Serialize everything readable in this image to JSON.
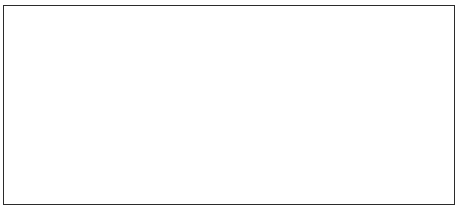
{
  "chart_data": {
    "type": "line",
    "title": "",
    "xlabel": "",
    "ylabel": "",
    "ylim": [
      0,
      1800
    ],
    "ytick_step": 200,
    "grid": true,
    "legend_position": "right",
    "x": [
      1976,
      1977,
      1978,
      1979,
      1980,
      1981,
      1982,
      1983,
      1984,
      1985,
      1986,
      1987,
      1988,
      1989,
      1990,
      1991,
      1992,
      1993,
      1994,
      1995,
      1996,
      1997,
      1998,
      1999,
      2000,
      2001,
      2002,
      2003
    ],
    "xtick_labels": [
      "1976",
      "",
      "1978",
      "",
      "1980",
      "",
      "1982",
      "",
      "1984",
      "",
      "1986",
      "",
      "1988",
      "",
      "1990",
      "",
      "1992",
      "",
      "1994",
      "",
      "1996",
      "",
      "1998",
      "",
      "2000",
      "",
      "2002",
      ""
    ],
    "xtick_labels_shown": [
      "1976",
      "1978",
      "1980",
      "1982",
      "1984",
      "1986",
      "1988",
      "1990",
      "1992",
      "1994",
      "1996",
      "1998",
      "2000",
      "2002"
    ],
    "yticks": [
      0,
      200,
      400,
      600,
      800,
      1000,
      1200,
      1400,
      1600,
      1800
    ],
    "ytick_labels": [
      "0",
      "200",
      "400",
      "600",
      "800",
      "1,000",
      "1,200",
      "1,400",
      "1,600",
      "1,800"
    ],
    "series": [
      {
        "name": "Male",
        "marker": "diamond",
        "color": "#000000",
        "values": [
          1380,
          1310,
          1190,
          1240,
          1250,
          1160,
          1100,
          1070,
          1030,
          1000,
          1000,
          1010,
          970,
          900,
          880,
          880,
          830,
          800,
          700,
          680,
          680,
          690,
          560,
          530,
          500,
          470,
          440,
          390
        ]
      },
      {
        "name": "Female",
        "marker": "square",
        "color": "#000000",
        "values": [
          1600,
          1450,
          1470,
          1500,
          1520,
          1550,
          1540,
          1480,
          1440,
          1520,
          1560,
          1550,
          1420,
          1450,
          1560,
          1400,
          1400,
          1550,
          1500,
          1340,
          1280,
          1300,
          1240,
          1300,
          1250,
          1250,
          1180,
          1160
        ]
      }
    ]
  },
  "legend": {
    "items": [
      {
        "label": "Male",
        "marker": "diamond"
      },
      {
        "label": "Female",
        "marker": "square"
      }
    ]
  },
  "axis": {
    "y_min_label": "0",
    "y_max_label": "1,800"
  }
}
